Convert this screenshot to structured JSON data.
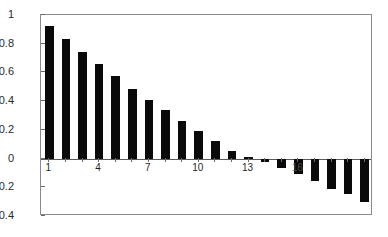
{
  "chart_data": {
    "type": "bar",
    "title": "",
    "subtitle": "",
    "xlabel": "",
    "ylabel": "",
    "categories": [
      "1",
      "2",
      "3",
      "4",
      "5",
      "6",
      "7",
      "8",
      "9",
      "10",
      "11",
      "12",
      "13",
      "14",
      "15",
      "16",
      "17",
      "18",
      "19",
      "20"
    ],
    "values": [
      0.92,
      0.835,
      0.745,
      0.66,
      0.575,
      0.485,
      0.41,
      0.335,
      0.26,
      0.19,
      0.12,
      0.055,
      0.01,
      -0.025,
      -0.065,
      -0.105,
      -0.155,
      -0.21,
      -0.25,
      -0.3
    ],
    "series": [
      {
        "name": "values",
        "values": [
          0.92,
          0.835,
          0.745,
          0.66,
          0.575,
          0.485,
          0.41,
          0.335,
          0.26,
          0.19,
          0.12,
          0.055,
          0.01,
          -0.025,
          -0.065,
          -0.105,
          -0.155,
          -0.21,
          -0.25,
          -0.3
        ]
      }
    ],
    "ylim": [
      -0.4,
      1.0
    ],
    "yticks": [
      1,
      0.8,
      0.6,
      0.4,
      0.2,
      0,
      -0.2,
      -0.4
    ],
    "ytick_labels": [
      "1",
      "0.8",
      "0.6",
      "0.4",
      "0.2",
      "0",
      "−0.2",
      "−0.4"
    ],
    "xticks": [
      1,
      4,
      7,
      10,
      13,
      16
    ],
    "xtick_labels": [
      "1",
      "4",
      "7",
      "10",
      "13",
      "16"
    ],
    "grid": false,
    "legend": false,
    "legend_position": "none",
    "bar_color": "#0a0a0a",
    "axis_color": "#8a8a8a",
    "background_color": "#ffffff",
    "annotations": []
  }
}
